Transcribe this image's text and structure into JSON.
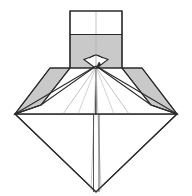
{
  "figure": {
    "canvas": {
      "width": 192,
      "height": 196
    },
    "colors": {
      "background": "#ffffff",
      "paper_white": "#ffffff",
      "paper_shaded": "#c9c9c9",
      "paper_shaded_light": "#d2d2d2",
      "outline": "#2b2b2b",
      "crease": "#a9a9a9",
      "crease_soft": "#c0c0c0"
    },
    "parts": [
      {
        "name": "top-flap-white-band",
        "kind": "polygon",
        "fill": "paper_white",
        "stroke": "outline",
        "points": "70,11 122,11 122,34 70,34"
      },
      {
        "name": "top-flap-shaded-band",
        "kind": "polygon",
        "fill": "paper_shaded",
        "stroke": "outline",
        "points": "70,34 122,34 122,68 70,68"
      },
      {
        "name": "left-wing-shaded-band",
        "kind": "polygon",
        "fill": "paper_shaded",
        "stroke": "outline",
        "points": "50,68 70,68 41,105 15,114"
      },
      {
        "name": "right-wing-shaded-band",
        "kind": "polygon",
        "fill": "paper_shaded",
        "stroke": "outline",
        "points": "122,68 142,68 177,114 151,105"
      },
      {
        "name": "left-upper-white-face",
        "kind": "polygon",
        "fill": "paper_white",
        "stroke": "outline",
        "points": "15,114 41,105 96,66 96,114"
      },
      {
        "name": "right-upper-white-face",
        "kind": "polygon",
        "fill": "paper_white",
        "stroke": "outline",
        "points": "96,66 151,105 177,114 96,114"
      },
      {
        "name": "lower-diamond-body",
        "kind": "polygon",
        "fill": "paper_white",
        "stroke": "outline",
        "points": "15,114 96,114 177,114 96,192"
      },
      {
        "name": "center-notch-diamond",
        "kind": "polygon",
        "fill": "paper_white",
        "stroke": "outline",
        "points": "84,59 96,68 108,59 96,55"
      }
    ],
    "creases": [
      {
        "name": "top-flap-center-crease",
        "from": "96,11",
        "to": "96,66"
      },
      {
        "name": "left-inner-crease",
        "from": "96,67",
        "to": "63,114"
      },
      {
        "name": "right-inner-crease",
        "from": "96,67",
        "to": "129,114"
      },
      {
        "name": "left-long-crease",
        "from": "96,67",
        "to": "92,190"
      },
      {
        "name": "right-long-crease",
        "from": "96,67",
        "to": "100,190"
      },
      {
        "name": "bottom-slit-left-edge",
        "from": "93,114",
        "to": "93,192"
      },
      {
        "name": "bottom-slit-right-edge",
        "from": "99,114",
        "to": "99,192"
      },
      {
        "name": "shoulder-horizontal",
        "from": "50,68",
        "to": "142,68"
      },
      {
        "name": "center-small-arc",
        "from": "90,56",
        "to": "102,56"
      }
    ]
  }
}
